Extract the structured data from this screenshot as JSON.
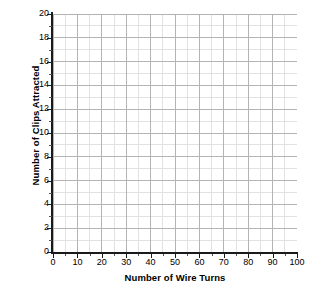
{
  "chart_data": {
    "type": "scatter",
    "title": "",
    "xlabel": "Number of Wire Turns",
    "ylabel": "Number of Clips Attracted",
    "xlim": [
      0,
      100
    ],
    "ylim": [
      0,
      20
    ],
    "x_ticks": [
      0,
      10,
      20,
      30,
      40,
      50,
      60,
      70,
      80,
      90,
      100
    ],
    "y_ticks": [
      0,
      2,
      4,
      6,
      8,
      10,
      12,
      14,
      16,
      18,
      20
    ],
    "x_tick_labels": [
      "0",
      "10",
      "20",
      "30",
      "40",
      "50",
      "60",
      "70",
      "80",
      "90",
      "100"
    ],
    "y_tick_labels": [
      "0",
      "2",
      "4",
      "6",
      "8",
      "10",
      "12",
      "14",
      "16",
      "18",
      "20"
    ],
    "x_minor_step": 5,
    "y_minor_step": 1,
    "grid": true,
    "grid_major_color": "#b3b3b3",
    "grid_minor_color": "#e2e2e2",
    "axis_color": "#1a1a1a",
    "background": "#ffffff",
    "legend": null,
    "series": [],
    "values": [],
    "annotations": [],
    "note": "Empty grid — blank graph with no plotted data points"
  },
  "axes": {
    "x_title": "Number of Wire Turns",
    "y_title": "Number of Clips Attracted"
  }
}
